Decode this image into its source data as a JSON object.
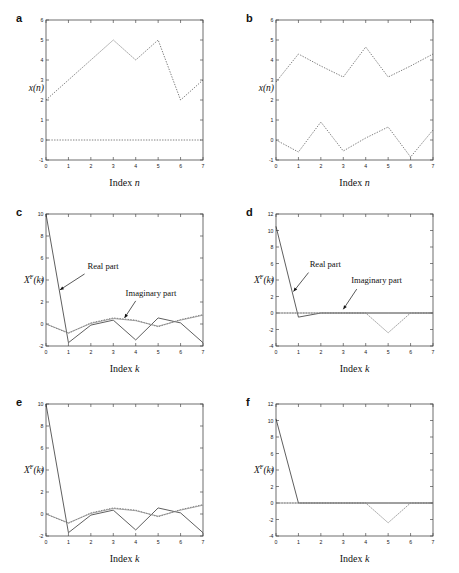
{
  "figure": {
    "panels": [
      {
        "label": "a",
        "xlabel_prefix": "Index ",
        "xlabel_var": "n",
        "ylabel": "x(n)",
        "ylabel_sup": "",
        "xlim": [
          0,
          7
        ],
        "ylim": [
          -1,
          6
        ],
        "xticks": [
          0,
          1,
          2,
          3,
          4,
          5,
          6,
          7
        ],
        "yticks": [
          -1,
          0,
          1,
          2,
          3,
          4,
          5,
          6
        ],
        "annotations": []
      },
      {
        "label": "b",
        "xlabel_prefix": "Index ",
        "xlabel_var": "n",
        "ylabel": "x(n)",
        "ylabel_sup": "",
        "xlim": [
          0,
          7
        ],
        "ylim": [
          -1,
          6
        ],
        "xticks": [
          0,
          1,
          2,
          3,
          4,
          5,
          6,
          7
        ],
        "yticks": [
          -1,
          0,
          1,
          2,
          3,
          4,
          5,
          6
        ],
        "annotations": []
      },
      {
        "label": "c",
        "xlabel_prefix": "Index ",
        "xlabel_var": "k",
        "ylabel": "X(k)",
        "ylabel_sup": "F",
        "xlim": [
          0,
          7
        ],
        "ylim": [
          -2,
          10
        ],
        "xticks": [
          0,
          1,
          2,
          3,
          4,
          5,
          6,
          7
        ],
        "yticks": [
          -2,
          0,
          2,
          4,
          6,
          8,
          10
        ],
        "annotations": [
          {
            "text": "Real part",
            "tx": 1.85,
            "ty": 5.0,
            "ax0": 1.72,
            "ay0": 4.55,
            "ax1": 0.62,
            "ay1": 3.1
          },
          {
            "text": "Imaginary part",
            "tx": 3.55,
            "ty": 2.55,
            "ax0": 4.0,
            "ay0": 2.1,
            "ax1": 3.5,
            "ay1": 0.55
          }
        ]
      },
      {
        "label": "d",
        "xlabel_prefix": "Index ",
        "xlabel_var": "k",
        "ylabel": "X(k)",
        "ylabel_sup": "F",
        "xlim": [
          0,
          7
        ],
        "ylim": [
          -4,
          12
        ],
        "xticks": [
          0,
          1,
          2,
          3,
          4,
          5,
          6,
          7
        ],
        "yticks": [
          -4,
          -2,
          0,
          2,
          4,
          6,
          8,
          10,
          12
        ],
        "annotations": [
          {
            "text": "Real part",
            "tx": 1.5,
            "ty": 5.6,
            "ax0": 1.45,
            "ay0": 4.9,
            "ax1": 0.78,
            "ay1": 2.6
          },
          {
            "text": "Imaginary part",
            "tx": 3.35,
            "ty": 3.6,
            "ax0": 3.6,
            "ay0": 2.9,
            "ax1": 3.0,
            "ay1": 0.45
          }
        ]
      },
      {
        "label": "e",
        "xlabel_prefix": "Index ",
        "xlabel_var": "k",
        "ylabel": "X(k)",
        "ylabel_sup": "F",
        "xlim": [
          0,
          7
        ],
        "ylim": [
          -2,
          10
        ],
        "xticks": [
          0,
          1,
          2,
          3,
          4,
          5,
          6,
          7
        ],
        "yticks": [
          -2,
          0,
          2,
          4,
          6,
          8,
          10
        ],
        "annotations": []
      },
      {
        "label": "f",
        "xlabel_prefix": "Index ",
        "xlabel_var": "k",
        "ylabel": "X(k)",
        "ylabel_sup": "F",
        "xlim": [
          0,
          7
        ],
        "ylim": [
          -4,
          12
        ],
        "xticks": [
          0,
          1,
          2,
          3,
          4,
          5,
          6,
          7
        ],
        "yticks": [
          -4,
          -2,
          0,
          2,
          4,
          6,
          8,
          10,
          12
        ],
        "annotations": []
      }
    ]
  },
  "chart_data": [
    {
      "type": "line",
      "panel": "a",
      "title": "",
      "xlabel": "Index n",
      "ylabel": "x(n)",
      "xlim": [
        0,
        7
      ],
      "ylim": [
        -1,
        6
      ],
      "x": [
        0,
        1,
        2,
        3,
        4,
        5,
        6,
        7
      ],
      "grid": false,
      "legend": "none",
      "series": [
        {
          "name": "signal x(n)",
          "style": "dotted",
          "values": [
            2,
            3,
            4,
            5,
            4,
            5,
            2,
            3
          ]
        },
        {
          "name": "zero line",
          "style": "dotted",
          "values": [
            0,
            0,
            0,
            0,
            0,
            0,
            0,
            0
          ]
        }
      ]
    },
    {
      "type": "line",
      "panel": "b",
      "title": "",
      "xlabel": "Index n",
      "ylabel": "x(n)",
      "xlim": [
        0,
        7
      ],
      "ylim": [
        -1,
        6
      ],
      "x": [
        0,
        1,
        2,
        3,
        4,
        5,
        6,
        7
      ],
      "grid": false,
      "legend": "none",
      "series": [
        {
          "name": "noisy signal upper",
          "style": "dotted",
          "values": [
            2.9,
            4.3,
            3.7,
            3.15,
            4.65,
            3.15,
            3.7,
            4.3
          ]
        },
        {
          "name": "noise lower",
          "style": "dotted",
          "values": [
            0.0,
            -0.6,
            0.9,
            -0.55,
            0.1,
            0.65,
            -0.85,
            0.5
          ]
        }
      ]
    },
    {
      "type": "line",
      "panel": "c",
      "title": "",
      "xlabel": "Index k",
      "ylabel": "X^F(k)",
      "xlim": [
        0,
        7
      ],
      "ylim": [
        -2,
        10
      ],
      "x": [
        0,
        1,
        2,
        3,
        4,
        5,
        6,
        7
      ],
      "grid": false,
      "legend": "annotated",
      "series": [
        {
          "name": "Real part",
          "style": "solid",
          "values": [
            10.0,
            -1.7,
            -0.1,
            0.35,
            -1.45,
            0.55,
            0.1,
            -1.7
          ]
        },
        {
          "name": "Imaginary part",
          "style": "dotted",
          "values": [
            0.0,
            -0.85,
            0.1,
            0.55,
            0.35,
            -0.25,
            0.4,
            0.85
          ]
        },
        {
          "name": "grey reference",
          "style": "grey",
          "values": [
            0.0,
            -0.8,
            0.05,
            0.5,
            0.3,
            -0.2,
            0.35,
            0.8
          ]
        }
      ]
    },
    {
      "type": "line",
      "panel": "d",
      "title": "",
      "xlabel": "Index k",
      "ylabel": "X^F(k)",
      "xlim": [
        0,
        7
      ],
      "ylim": [
        -4,
        12
      ],
      "x": [
        0,
        1,
        2,
        3,
        4,
        5,
        6,
        7
      ],
      "grid": false,
      "legend": "annotated",
      "series": [
        {
          "name": "Real part",
          "style": "solid",
          "values": [
            10.5,
            -0.5,
            0.0,
            0.0,
            0.0,
            0.0,
            0.0,
            0.0
          ]
        },
        {
          "name": "Imaginary part",
          "style": "dotted",
          "values": [
            0.0,
            0.0,
            0.0,
            0.0,
            0.0,
            -2.4,
            0.0,
            0.0
          ]
        },
        {
          "name": "grey reference",
          "style": "grey",
          "values": [
            0.0,
            0.0,
            0.0,
            0.0,
            0.0,
            0.0,
            0.0,
            0.0
          ]
        }
      ]
    },
    {
      "type": "line",
      "panel": "e",
      "title": "",
      "xlabel": "Index k",
      "ylabel": "X^F(k)",
      "xlim": [
        0,
        7
      ],
      "ylim": [
        -2,
        10
      ],
      "x": [
        0,
        1,
        2,
        3,
        4,
        5,
        6,
        7
      ],
      "grid": false,
      "legend": "none",
      "series": [
        {
          "name": "Real part",
          "style": "solid",
          "values": [
            10.0,
            -1.7,
            -0.1,
            0.35,
            -1.45,
            0.55,
            0.1,
            -1.7
          ]
        },
        {
          "name": "Imaginary part",
          "style": "dotted",
          "values": [
            0.0,
            -0.85,
            0.1,
            0.55,
            0.35,
            -0.25,
            0.4,
            0.85
          ]
        },
        {
          "name": "grey reference",
          "style": "grey",
          "values": [
            0.0,
            -0.8,
            0.05,
            0.5,
            0.3,
            -0.2,
            0.35,
            0.8
          ]
        }
      ]
    },
    {
      "type": "line",
      "panel": "f",
      "title": "",
      "xlabel": "Index k",
      "ylabel": "X^F(k)",
      "xlim": [
        0,
        7
      ],
      "ylim": [
        -4,
        12
      ],
      "x": [
        0,
        1,
        2,
        3,
        4,
        5,
        6,
        7
      ],
      "grid": false,
      "legend": "none",
      "series": [
        {
          "name": "Real part",
          "style": "solid",
          "values": [
            10.2,
            0.0,
            0.0,
            0.0,
            0.0,
            0.0,
            0.0,
            0.0
          ]
        },
        {
          "name": "Imaginary part",
          "style": "dotted",
          "values": [
            0.0,
            0.0,
            0.0,
            0.0,
            0.0,
            -2.4,
            0.0,
            0.0
          ]
        },
        {
          "name": "grey reference",
          "style": "grey",
          "values": [
            0.0,
            0.0,
            0.0,
            0.0,
            0.0,
            0.0,
            0.0,
            0.0
          ]
        }
      ]
    }
  ]
}
